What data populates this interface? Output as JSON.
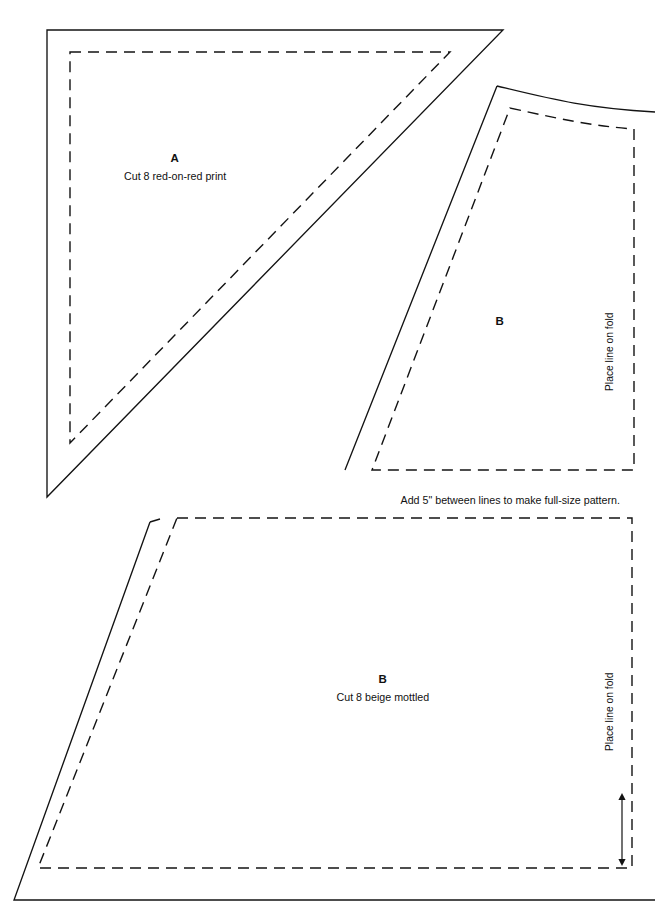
{
  "sheet": {
    "title": "Quilt pattern pieces",
    "width": 661,
    "height": 920,
    "background": "#ffffff",
    "ink_color": "#131313"
  },
  "pieces": [
    {
      "id": "piece-a-triangle",
      "letter": "A",
      "description": "Cut 8 red-on-red print",
      "letter_pos": {
        "x": 175,
        "y": 152
      },
      "desc_pos": {
        "x": 175,
        "y": 170
      },
      "cut_line": "M 47 30 L 503 30 L 47 497 Z",
      "seam_line": "M 70 52 L 450 52 L 70 443 Z"
    },
    {
      "id": "piece-b-small",
      "letter": "B",
      "description": "",
      "letter_pos": {
        "x": 500,
        "y": 315
      },
      "cut_line": "M 497 86 L 345 470 M 497 86 C 551 99 585 108 655 112",
      "seam_line": "M 510 108 C 560 119 592 126 634 129 L 634 470 L 372 470 Z",
      "fold_label": "Place line on fold",
      "fold_label_pos": {
        "x": 615,
        "y": 380
      }
    },
    {
      "id": "piece-b-large",
      "letter": "B",
      "description": "Cut 8 beige mottled",
      "letter_pos": {
        "x": 383,
        "y": 673
      },
      "desc_pos": {
        "x": 383,
        "y": 691
      },
      "cut_line": "M 150 522 L 14 900 L 655 900 M 150 522 L 160 519",
      "seam_line": "M 177 518 L 632 518 L 632 868 L 38 868 L 177 518",
      "fold_label": "Place line on fold",
      "fold_label_pos": {
        "x": 615,
        "y": 740
      }
    }
  ],
  "notes": [
    {
      "id": "scale-note",
      "text": "Add 5\" between lines to make full-size pattern.",
      "pos": {
        "x": 510,
        "y": 494
      }
    }
  ],
  "measurement_arrow": {
    "id": "seam-allowance-arrow",
    "x": 622,
    "y_top": 793,
    "y_bottom": 866
  }
}
